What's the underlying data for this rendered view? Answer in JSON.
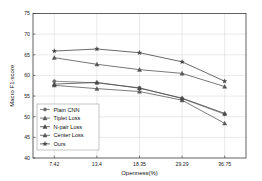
{
  "chart_data": {
    "type": "line",
    "title": "",
    "xlabel": "Openness(%)",
    "ylabel": "Macro F1-score",
    "categories": [
      "7.42",
      "13.4",
      "18.35",
      "29.29",
      "36.75"
    ],
    "x_tick_labels": [
      "7.42",
      "13.4",
      "18.35",
      "29.29",
      "36.75"
    ],
    "y_tick_labels": [
      "40",
      "45",
      "50",
      "55",
      "60",
      "65",
      "70",
      "75"
    ],
    "ylim": [
      40,
      75
    ],
    "grid": true,
    "legend_position": "lower-left",
    "series": [
      {
        "name": "Plain CNN",
        "marker": "circle",
        "color": "#6f6f6f",
        "values": [
          58.6,
          58.2,
          57.0,
          54.4,
          50.6
        ]
      },
      {
        "name": "Tiplet Loss",
        "marker": "triangle",
        "color": "#5a5a5a",
        "values": [
          57.6,
          56.8,
          56.1,
          54.0,
          48.4
        ]
      },
      {
        "name": "N-pair Loss",
        "marker": "triangle",
        "color": "#4a4a4a",
        "values": [
          57.9,
          58.3,
          56.9,
          54.5,
          50.8
        ]
      },
      {
        "name": "Center Loss",
        "marker": "triangle",
        "color": "#555555",
        "values": [
          64.3,
          62.7,
          61.4,
          60.5,
          57.3
        ]
      },
      {
        "name": "Ours",
        "marker": "star",
        "color": "#444444",
        "values": [
          65.9,
          66.4,
          65.5,
          63.3,
          58.6
        ]
      }
    ]
  },
  "legend": {
    "items": [
      {
        "label": "Plain CNN"
      },
      {
        "label": "Tiplet Loss"
      },
      {
        "label": "N-pair Loss"
      },
      {
        "label": "Center Loss"
      },
      {
        "label": "Ours"
      }
    ]
  }
}
